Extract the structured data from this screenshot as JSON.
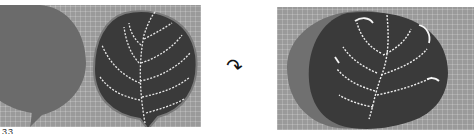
{
  "figure": {
    "left_panel": {
      "description": "Two felt leaf shapes on a cutting mat: a plain gray leaf and a dark leaf with white dashed vein stitching",
      "leaf_colors": {
        "plain": "#6b6b6b",
        "stitched": "#3a3a3a",
        "stitch": "#e8e8e8"
      }
    },
    "arrow": {
      "icon": "curved-arrow-icon",
      "glyph": "↷"
    },
    "right_panel": {
      "description": "Stitched dark leaf layered on top of gray leaf, with white vein embroidery",
      "leaf_colors": {
        "back": "#707070",
        "front": "#3a3a3a",
        "stitch": "#f0f0f0"
      }
    },
    "caption_fragment": "33"
  },
  "colors": {
    "mat": "#9a9a9a",
    "mat_grid": "#b4b4b4",
    "background": "#ffffff"
  }
}
